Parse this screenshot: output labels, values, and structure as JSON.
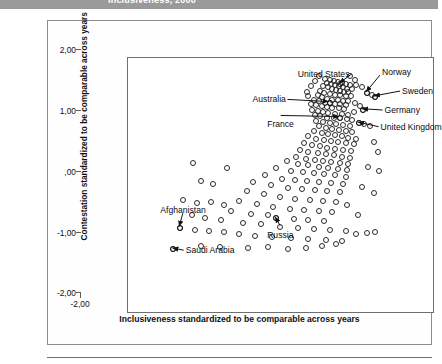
{
  "banner": {
    "title": "Inclusiveness, 2000"
  },
  "figure": {
    "xlabel": "Inclusiveness standardized to be comparable across years",
    "ylabel": "Contestation standardized to be comparable across years",
    "xticks": [
      "-2,00",
      "-1,00",
      ",00",
      "1,00",
      "2,00"
    ],
    "yticks": [
      "2,00",
      "1,00",
      ",00",
      "-1,00",
      "-2,00"
    ]
  },
  "chart_data": {
    "type": "scatter",
    "title": "Inclusiveness, 2000",
    "xlabel": "Inclusiveness standardized to be comparable across years",
    "ylabel": "Contestation standardized to be comparable across years",
    "xlim": [
      -2.4,
      2.2
    ],
    "ylim": [
      -2.35,
      2.25
    ],
    "xticks": [
      -2.0,
      -1.0,
      0.0,
      1.0,
      2.0
    ],
    "yticks": [
      2.0,
      1.0,
      0.0,
      -1.0,
      -2.0
    ],
    "xtick_labels": [
      "-2,00",
      "-1,00",
      ",00",
      "1,00",
      "2,00"
    ],
    "ytick_labels": [
      "2,00",
      "1,00",
      ",00",
      "-1,00",
      "-2,00"
    ],
    "grid": false,
    "legend": null,
    "marker": "open-circle",
    "annotations": [
      {
        "label": "United States",
        "x": 0.78,
        "y": 1.78,
        "label_x": 0.16,
        "label_y": 1.93,
        "arrow": "right"
      },
      {
        "label": "Norway",
        "x": 1.18,
        "y": 1.62,
        "label_x": 1.42,
        "label_y": 1.96,
        "arrow": "down-left"
      },
      {
        "label": "Sweden",
        "x": 1.3,
        "y": 1.55,
        "label_x": 1.72,
        "label_y": 1.62,
        "arrow": "left"
      },
      {
        "label": "Germany",
        "x": 1.12,
        "y": 1.32,
        "label_x": 1.46,
        "label_y": 1.28,
        "arrow": "left"
      },
      {
        "label": "United Kingdom",
        "x": 1.06,
        "y": 1.08,
        "label_x": 1.4,
        "label_y": 0.98,
        "arrow": "left"
      },
      {
        "label": "Australia",
        "x": 0.62,
        "y": 1.45,
        "label_x": -0.52,
        "label_y": 1.47,
        "arrow": "right"
      },
      {
        "label": "France",
        "x": 0.78,
        "y": 1.18,
        "label_x": -0.3,
        "label_y": 1.02,
        "arrow": "up-right"
      },
      {
        "label": "Afghanistan",
        "x": -1.62,
        "y": -0.8,
        "label_x": -1.9,
        "label_y": -0.52,
        "arrow": "down-right"
      },
      {
        "label": "Saudi Arabia",
        "x": -1.72,
        "y": -1.18,
        "label_x": -1.52,
        "label_y": -1.24,
        "arrow": "left"
      },
      {
        "label": "Russia",
        "x": -0.18,
        "y": -0.62,
        "label_x": -0.3,
        "label_y": -0.96,
        "arrow": "up"
      }
    ],
    "points": [
      [
        0.55,
        1.88
      ],
      [
        0.62,
        1.86
      ],
      [
        0.68,
        1.84
      ],
      [
        0.74,
        1.82
      ],
      [
        0.8,
        1.8
      ],
      [
        0.86,
        1.78
      ],
      [
        0.92,
        1.76
      ],
      [
        0.58,
        1.8
      ],
      [
        0.64,
        1.78
      ],
      [
        0.7,
        1.76
      ],
      [
        0.76,
        1.74
      ],
      [
        0.82,
        1.72
      ],
      [
        0.88,
        1.7
      ],
      [
        0.95,
        1.7
      ],
      [
        0.52,
        1.74
      ],
      [
        0.6,
        1.72
      ],
      [
        0.66,
        1.7
      ],
      [
        0.72,
        1.68
      ],
      [
        0.78,
        1.66
      ],
      [
        0.84,
        1.64
      ],
      [
        0.9,
        1.64
      ],
      [
        1.02,
        1.76
      ],
      [
        1.1,
        1.72
      ],
      [
        1.18,
        1.62
      ],
      [
        1.26,
        1.58
      ],
      [
        1.3,
        1.55
      ],
      [
        0.48,
        1.66
      ],
      [
        0.54,
        1.62
      ],
      [
        0.62,
        1.6
      ],
      [
        0.7,
        1.58
      ],
      [
        0.78,
        1.58
      ],
      [
        0.86,
        1.56
      ],
      [
        0.94,
        1.56
      ],
      [
        0.44,
        1.58
      ],
      [
        0.5,
        1.55
      ],
      [
        0.58,
        1.52
      ],
      [
        0.66,
        1.5
      ],
      [
        0.74,
        1.5
      ],
      [
        0.82,
        1.48
      ],
      [
        0.9,
        1.48
      ],
      [
        0.38,
        1.5
      ],
      [
        0.46,
        1.47
      ],
      [
        0.55,
        1.45
      ],
      [
        0.62,
        1.45
      ],
      [
        0.7,
        1.43
      ],
      [
        0.78,
        1.42
      ],
      [
        0.86,
        1.4
      ],
      [
        0.34,
        1.42
      ],
      [
        0.42,
        1.4
      ],
      [
        0.5,
        1.38
      ],
      [
        0.58,
        1.37
      ],
      [
        0.66,
        1.36
      ],
      [
        0.76,
        1.35
      ],
      [
        0.84,
        1.34
      ],
      [
        1.0,
        1.44
      ],
      [
        1.08,
        1.38
      ],
      [
        1.12,
        1.32
      ],
      [
        0.98,
        1.28
      ],
      [
        0.36,
        1.32
      ],
      [
        0.44,
        1.3
      ],
      [
        0.52,
        1.28
      ],
      [
        0.6,
        1.26
      ],
      [
        0.7,
        1.25
      ],
      [
        0.8,
        1.24
      ],
      [
        0.9,
        1.22
      ],
      [
        0.4,
        1.22
      ],
      [
        0.48,
        1.2
      ],
      [
        0.58,
        1.18
      ],
      [
        0.68,
        1.18
      ],
      [
        0.78,
        1.18
      ],
      [
        0.88,
        1.16
      ],
      [
        0.96,
        1.14
      ],
      [
        1.06,
        1.08
      ],
      [
        1.14,
        1.06
      ],
      [
        1.22,
        1.02
      ],
      [
        0.42,
        1.12
      ],
      [
        0.52,
        1.1
      ],
      [
        0.62,
        1.08
      ],
      [
        0.72,
        1.06
      ],
      [
        0.82,
        1.04
      ],
      [
        0.92,
        1.02
      ],
      [
        0.46,
        1.02
      ],
      [
        0.56,
        1.0
      ],
      [
        0.66,
        0.98
      ],
      [
        0.76,
        0.96
      ],
      [
        0.86,
        0.94
      ],
      [
        0.96,
        0.92
      ],
      [
        0.38,
        0.94
      ],
      [
        0.5,
        0.9
      ],
      [
        0.6,
        0.88
      ],
      [
        0.7,
        0.86
      ],
      [
        0.8,
        0.84
      ],
      [
        0.9,
        0.82
      ],
      [
        1.02,
        0.8
      ],
      [
        0.3,
        0.84
      ],
      [
        0.42,
        0.8
      ],
      [
        0.54,
        0.78
      ],
      [
        0.64,
        0.76
      ],
      [
        0.74,
        0.74
      ],
      [
        0.86,
        0.72
      ],
      [
        0.98,
        0.7
      ],
      [
        0.24,
        0.72
      ],
      [
        0.36,
        0.68
      ],
      [
        0.48,
        0.66
      ],
      [
        0.58,
        0.64
      ],
      [
        0.7,
        0.62
      ],
      [
        0.82,
        0.6
      ],
      [
        0.94,
        0.58
      ],
      [
        1.28,
        0.74
      ],
      [
        1.34,
        0.56
      ],
      [
        0.18,
        0.6
      ],
      [
        0.3,
        0.56
      ],
      [
        0.44,
        0.54
      ],
      [
        0.56,
        0.52
      ],
      [
        0.68,
        0.5
      ],
      [
        0.8,
        0.48
      ],
      [
        0.92,
        0.46
      ],
      [
        0.12,
        0.48
      ],
      [
        0.26,
        0.44
      ],
      [
        0.4,
        0.42
      ],
      [
        0.52,
        0.4
      ],
      [
        0.64,
        0.38
      ],
      [
        0.78,
        0.36
      ],
      [
        0.9,
        0.34
      ],
      [
        -0.02,
        0.4
      ],
      [
        0.14,
        0.34
      ],
      [
        0.3,
        0.32
      ],
      [
        0.46,
        0.3
      ],
      [
        0.6,
        0.28
      ],
      [
        0.74,
        0.26
      ],
      [
        0.88,
        0.24
      ],
      [
        1.2,
        0.3
      ],
      [
        1.36,
        0.22
      ],
      [
        -0.18,
        0.28
      ],
      [
        0.04,
        0.22
      ],
      [
        0.22,
        0.2
      ],
      [
        0.38,
        0.18
      ],
      [
        0.54,
        0.16
      ],
      [
        0.7,
        0.14
      ],
      [
        0.86,
        0.12
      ],
      [
        -0.34,
        0.14
      ],
      [
        -0.1,
        0.08
      ],
      [
        0.1,
        0.06
      ],
      [
        0.28,
        0.04
      ],
      [
        0.46,
        0.02
      ],
      [
        0.64,
        0.0
      ],
      [
        0.82,
        -0.02
      ],
      [
        -0.52,
        0.02
      ],
      [
        -0.26,
        -0.04
      ],
      [
        0.0,
        -0.08
      ],
      [
        0.2,
        -0.1
      ],
      [
        0.4,
        -0.12
      ],
      [
        0.58,
        -0.14
      ],
      [
        0.78,
        -0.16
      ],
      [
        1.1,
        -0.06
      ],
      [
        1.28,
        -0.18
      ],
      [
        -0.62,
        -0.14
      ],
      [
        -0.36,
        -0.2
      ],
      [
        -0.12,
        -0.24
      ],
      [
        0.1,
        -0.28
      ],
      [
        0.32,
        -0.3
      ],
      [
        0.52,
        -0.32
      ],
      [
        0.72,
        -0.34
      ],
      [
        -0.74,
        -0.32
      ],
      [
        -0.46,
        -0.38
      ],
      [
        -0.22,
        -0.42
      ],
      [
        0.02,
        -0.46
      ],
      [
        0.24,
        -0.48
      ],
      [
        0.46,
        -0.5
      ],
      [
        0.66,
        -0.52
      ],
      [
        -0.86,
        -0.5
      ],
      [
        -0.56,
        -0.56
      ],
      [
        -0.3,
        -0.58
      ],
      [
        -0.18,
        -0.62
      ],
      [
        0.08,
        -0.64
      ],
      [
        0.3,
        -0.66
      ],
      [
        0.54,
        -0.68
      ],
      [
        0.88,
        -0.4
      ],
      [
        1.04,
        -0.58
      ],
      [
        -1.0,
        -0.66
      ],
      [
        -0.68,
        -0.72
      ],
      [
        -0.4,
        -0.74
      ],
      [
        -0.12,
        -0.78
      ],
      [
        0.14,
        -0.8
      ],
      [
        0.38,
        -0.82
      ],
      [
        0.62,
        -0.84
      ],
      [
        -1.24,
        -0.62
      ],
      [
        -1.44,
        -0.58
      ],
      [
        -1.62,
        -0.8
      ],
      [
        -1.4,
        -0.84
      ],
      [
        -1.18,
        -0.86
      ],
      [
        -0.96,
        -0.88
      ],
      [
        -0.74,
        -0.92
      ],
      [
        -0.5,
        -0.94
      ],
      [
        -0.24,
        -0.96
      ],
      [
        0.04,
        -0.98
      ],
      [
        0.3,
        -1.0
      ],
      [
        0.56,
        -1.02
      ],
      [
        0.8,
        -1.04
      ],
      [
        -1.72,
        -1.18
      ],
      [
        -1.3,
        -1.12
      ],
      [
        -1.02,
        -1.14
      ],
      [
        0.86,
        -0.86
      ],
      [
        1.02,
        -0.92
      ],
      [
        1.18,
        -0.9
      ],
      [
        1.3,
        -0.88
      ],
      [
        -0.6,
        -1.16
      ],
      [
        -0.3,
        -1.14
      ],
      [
        0.0,
        -1.18
      ],
      [
        0.26,
        -1.16
      ],
      [
        0.5,
        -1.12
      ],
      [
        0.72,
        -1.1
      ],
      [
        -1.58,
        -0.3
      ],
      [
        -1.36,
        -0.36
      ],
      [
        -1.16,
        -0.34
      ],
      [
        -0.96,
        -0.4
      ],
      [
        -1.3,
        0.04
      ],
      [
        -1.12,
        -0.02
      ],
      [
        -1.42,
        0.36
      ],
      [
        -0.92,
        0.28
      ],
      [
        0.92,
        1.92
      ],
      [
        1.0,
        1.86
      ],
      [
        0.46,
        1.92
      ],
      [
        0.4,
        1.84
      ],
      [
        0.34,
        1.74
      ],
      [
        0.28,
        1.64
      ],
      [
        0.3,
        1.56
      ]
    ]
  }
}
